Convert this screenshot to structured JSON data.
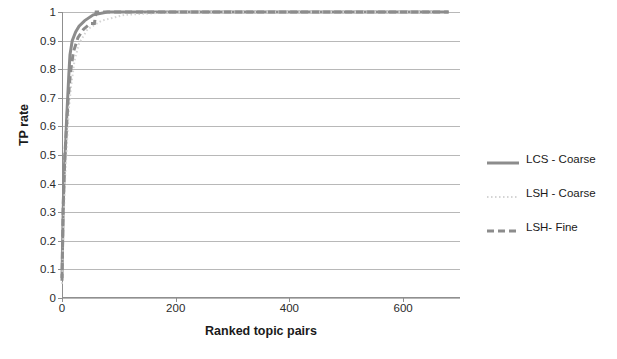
{
  "chart_data": {
    "type": "line",
    "title": "",
    "xlabel": "Ranked topic pairs",
    "ylabel": "TP rate",
    "xlim": [
      0,
      700
    ],
    "ylim": [
      0,
      1
    ],
    "xticks": [
      0,
      200,
      400,
      600
    ],
    "yticks": [
      "0",
      "0.1",
      "0.2",
      "0.3",
      "0.4",
      "0.5",
      "0.6",
      "0.7",
      "0.8",
      "0.9",
      "1"
    ],
    "grid": "horizontal",
    "legend_position": "right",
    "series": [
      {
        "name": "LCS - Coarse",
        "color": "#8c8c8c",
        "style": "solid",
        "width": 3,
        "x": [
          0,
          2,
          4,
          6,
          8,
          10,
          12,
          14,
          18,
          24,
          30,
          40,
          55,
          80,
          120,
          200,
          400,
          600,
          680
        ],
        "y": [
          0.07,
          0.3,
          0.45,
          0.52,
          0.62,
          0.7,
          0.78,
          0.85,
          0.9,
          0.93,
          0.95,
          0.97,
          0.99,
          1.0,
          1.0,
          1.0,
          1.0,
          1.0,
          1.0
        ]
      },
      {
        "name": "LSH - Coarse",
        "color": "#d4d4d4",
        "style": "dotted",
        "width": 2,
        "x": [
          0,
          3,
          6,
          9,
          12,
          16,
          22,
          30,
          45,
          70,
          110,
          200,
          400,
          600,
          660
        ],
        "y": [
          0.05,
          0.28,
          0.44,
          0.55,
          0.66,
          0.74,
          0.83,
          0.89,
          0.94,
          0.97,
          0.99,
          1.0,
          1.0,
          1.0,
          1.0
        ]
      },
      {
        "name": "LSH- Fine",
        "color": "#8c8c8c",
        "style": "dashed",
        "width": 3,
        "x": [
          0,
          2,
          5,
          8,
          11,
          15,
          20,
          28,
          38,
          50,
          57,
          60,
          100,
          200,
          400,
          600,
          680
        ],
        "y": [
          0.06,
          0.32,
          0.5,
          0.6,
          0.7,
          0.79,
          0.86,
          0.91,
          0.94,
          0.96,
          0.96,
          1.0,
          1.0,
          1.0,
          1.0,
          1.0,
          1.0
        ]
      }
    ]
  },
  "legend": {
    "items": [
      {
        "label": "LCS - Coarse"
      },
      {
        "label": "LSH - Coarse"
      },
      {
        "label": "LSH- Fine"
      }
    ]
  },
  "axes": {
    "y_title": "TP rate",
    "x_title": "Ranked topic pairs"
  }
}
